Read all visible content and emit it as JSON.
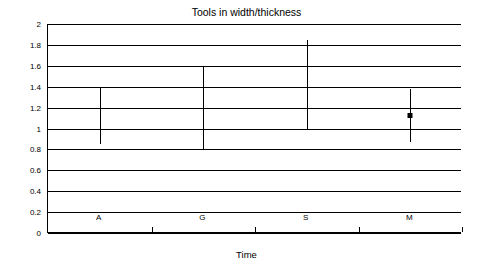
{
  "chart_data": {
    "type": "line",
    "title": "Tools in width/thickness",
    "xlabel": "Time",
    "ylabel": "Ratio",
    "grid": true,
    "legend": "none",
    "categories": [
      "A",
      "G",
      "S",
      "M"
    ],
    "ylim": [
      0,
      2
    ],
    "ytick_labels": [
      "0",
      "0.2",
      "0.4",
      "0.6",
      "0.8",
      "1",
      "1.2",
      "1.4",
      "1.6",
      "1.8",
      "2"
    ],
    "ytick_values": [
      0,
      0.2,
      0.4,
      0.6,
      0.8,
      1,
      1.2,
      1.4,
      1.6,
      1.8,
      2
    ],
    "series": [
      {
        "name": "Ratio range",
        "points": [
          {
            "category": "A",
            "low": 0.85,
            "high": 1.4,
            "mean": null
          },
          {
            "category": "G",
            "low": 0.79,
            "high": 1.6,
            "mean": null
          },
          {
            "category": "S",
            "low": 0.99,
            "high": 1.85,
            "mean": null
          },
          {
            "category": "M",
            "low": 0.87,
            "high": 1.38,
            "mean": 1.12
          }
        ]
      }
    ]
  }
}
